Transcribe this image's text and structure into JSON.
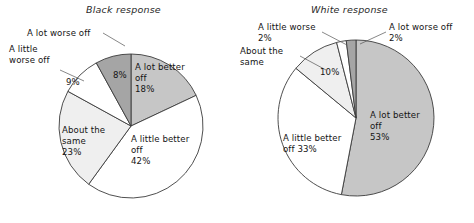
{
  "figure": {
    "background": "#ffffff",
    "outline_color": "#3b3b3b"
  },
  "charts": [
    {
      "id": "black-response",
      "title": "Black response",
      "center": [
        131,
        126
      ],
      "radius": 72,
      "slices": [
        {
          "key": "a-lot-better-off",
          "label": "A lot better\noff\n18%",
          "name": "A lot better off",
          "value": 18,
          "color": "#c6c6c6",
          "inside": true,
          "lx": 135,
          "ly": 62
        },
        {
          "key": "a-little-better-off",
          "label": "A little better\noff\n42%",
          "name": "A little better off",
          "value": 42,
          "color": "#ffffff",
          "inside": true,
          "lx": 131,
          "ly": 134
        },
        {
          "key": "about-the-same",
          "label": "About the\nsame\n23%",
          "name": "About the same",
          "value": 23,
          "color": "#efefef",
          "inside": true,
          "lx": 62,
          "ly": 125
        },
        {
          "key": "a-little-worse-off",
          "label": "A little\nworse off",
          "pct": "9%",
          "name": "A little worse off",
          "value": 9,
          "color": "#ffffff",
          "inside": false,
          "lx": 9,
          "ly": 44,
          "px": 66,
          "py": 77
        },
        {
          "key": "a-lot-worse-off",
          "label": "A lot worse off",
          "pct": "8%",
          "name": "A lot worse off",
          "value": 8,
          "color": "#a5a5a5",
          "inside": false,
          "lx": 27,
          "ly": 28,
          "px": 113,
          "py": 70
        }
      ],
      "leaders": [
        {
          "from": [
            103,
            33
          ],
          "to": [
            125,
            46
          ]
        },
        {
          "from": [
            60,
            70
          ],
          "to": [
            84,
            81
          ]
        }
      ]
    },
    {
      "id": "white-response",
      "title": "White response",
      "center": [
        356,
        118
      ],
      "radius": 78,
      "slices": [
        {
          "key": "a-lot-better-off",
          "label": "A lot better\noff\n53%",
          "name": "A lot better off",
          "value": 53,
          "color": "#c6c6c6",
          "inside": true,
          "lx": 370,
          "ly": 110
        },
        {
          "key": "a-little-better-off",
          "label": "A little better\noff 33%",
          "name": "A little better off",
          "value": 33,
          "color": "#ffffff",
          "inside": true,
          "lx": 283,
          "ly": 133
        },
        {
          "key": "about-the-same",
          "label": "About the\nsame",
          "pct": "10%",
          "name": "About the same",
          "value": 10,
          "color": "#efefef",
          "inside": false,
          "lx": 240,
          "ly": 46,
          "px": 320,
          "py": 67
        },
        {
          "key": "a-little-worse",
          "label": "A little worse\n2%",
          "name": "A little worse",
          "value": 2,
          "color": "#ffffff",
          "inside": false,
          "lx": 258,
          "ly": 22,
          "px": 0,
          "py": 0
        },
        {
          "key": "a-lot-worse-off",
          "label": "A lot worse off\n2%",
          "name": "A lot worse off",
          "value": 2,
          "color": "#a5a5a5",
          "inside": false,
          "lx": 389,
          "ly": 22,
          "px": 0,
          "py": 0
        }
      ],
      "leaders": [
        {
          "from": [
            322,
            32
          ],
          "to": [
            347,
            45
          ]
        },
        {
          "from": [
            300,
            56
          ],
          "to": [
            326,
            70
          ]
        },
        {
          "from": [
            386,
            32
          ],
          "to": [
            360,
            44
          ]
        }
      ]
    }
  ],
  "chart_data": [
    {
      "type": "pie",
      "title": "Black response",
      "categories": [
        "A lot better off",
        "A little better off",
        "About the same",
        "A little worse off",
        "A lot worse off"
      ],
      "values": [
        18,
        42,
        23,
        9,
        8
      ],
      "colors": [
        "#c6c6c6",
        "#ffffff",
        "#efefef",
        "#ffffff",
        "#a5a5a5"
      ],
      "units": "percent",
      "start_angle_deg": 0,
      "direction": "clockwise",
      "legend": "labels-on-slices"
    },
    {
      "type": "pie",
      "title": "White response",
      "categories": [
        "A lot better off",
        "A little better off",
        "About the same",
        "A little worse",
        "A lot worse off"
      ],
      "values": [
        53,
        33,
        10,
        2,
        2
      ],
      "colors": [
        "#c6c6c6",
        "#ffffff",
        "#efefef",
        "#ffffff",
        "#a5a5a5"
      ],
      "units": "percent",
      "start_angle_deg": 0,
      "direction": "clockwise",
      "legend": "labels-on-slices"
    }
  ]
}
